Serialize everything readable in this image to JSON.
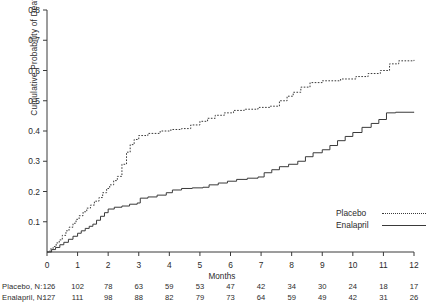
{
  "chart_data": {
    "type": "line",
    "title": "",
    "xlabel": "Months",
    "ylabel": "Cumulative Probability of Death",
    "xlim": [
      0,
      12
    ],
    "ylim": [
      0,
      0.8
    ],
    "xticks": [
      "0",
      "1",
      "2",
      "3",
      "4",
      "5",
      "6",
      "7",
      "8",
      "9",
      "10",
      "11",
      "12"
    ],
    "yticks": [
      "0.8",
      "0.7",
      "0.6",
      "0.5",
      "0.4",
      "0.3",
      "0.2",
      "0.1"
    ],
    "ytick_values": [
      0.8,
      0.7,
      0.6,
      0.5,
      0.4,
      0.3,
      0.2,
      0.1
    ],
    "grid": false,
    "legend_position": "lower right",
    "series": [
      {
        "name": "Placebo",
        "style": "dotted",
        "color": "#3a3a3a",
        "points": [
          [
            0.0,
            0.0
          ],
          [
            0.1,
            0.01
          ],
          [
            0.2,
            0.018
          ],
          [
            0.3,
            0.03
          ],
          [
            0.4,
            0.04
          ],
          [
            0.5,
            0.055
          ],
          [
            0.62,
            0.07
          ],
          [
            0.72,
            0.082
          ],
          [
            0.85,
            0.095
          ],
          [
            0.95,
            0.108
          ],
          [
            1.05,
            0.12
          ],
          [
            1.18,
            0.133
          ],
          [
            1.3,
            0.145
          ],
          [
            1.42,
            0.155
          ],
          [
            1.55,
            0.168
          ],
          [
            1.7,
            0.18
          ],
          [
            1.82,
            0.196
          ],
          [
            1.95,
            0.21
          ],
          [
            2.05,
            0.222
          ],
          [
            2.18,
            0.236
          ],
          [
            2.3,
            0.25
          ],
          [
            2.45,
            0.29
          ],
          [
            2.6,
            0.33
          ],
          [
            2.72,
            0.355
          ],
          [
            2.85,
            0.372
          ],
          [
            3.0,
            0.385
          ],
          [
            3.3,
            0.392
          ],
          [
            3.7,
            0.4
          ],
          [
            4.05,
            0.405
          ],
          [
            4.4,
            0.408
          ],
          [
            4.7,
            0.42
          ],
          [
            5.0,
            0.432
          ],
          [
            5.25,
            0.442
          ],
          [
            5.5,
            0.452
          ],
          [
            5.8,
            0.46
          ],
          [
            6.1,
            0.468
          ],
          [
            6.45,
            0.472
          ],
          [
            6.9,
            0.478
          ],
          [
            7.3,
            0.482
          ],
          [
            7.6,
            0.5
          ],
          [
            7.85,
            0.515
          ],
          [
            8.05,
            0.528
          ],
          [
            8.3,
            0.545
          ],
          [
            8.6,
            0.56
          ],
          [
            9.0,
            0.566
          ],
          [
            9.6,
            0.572
          ],
          [
            10.1,
            0.58
          ],
          [
            10.5,
            0.59
          ],
          [
            10.9,
            0.6
          ],
          [
            11.2,
            0.622
          ],
          [
            11.5,
            0.632
          ],
          [
            12.0,
            0.635
          ]
        ]
      },
      {
        "name": "Enalapril",
        "style": "solid",
        "color": "#3a3a3a",
        "points": [
          [
            0.0,
            0.0
          ],
          [
            0.15,
            0.008
          ],
          [
            0.28,
            0.015
          ],
          [
            0.42,
            0.024
          ],
          [
            0.55,
            0.032
          ],
          [
            0.7,
            0.042
          ],
          [
            0.85,
            0.052
          ],
          [
            1.0,
            0.062
          ],
          [
            1.12,
            0.07
          ],
          [
            1.25,
            0.078
          ],
          [
            1.38,
            0.085
          ],
          [
            1.5,
            0.092
          ],
          [
            1.62,
            0.105
          ],
          [
            1.75,
            0.118
          ],
          [
            1.88,
            0.13
          ],
          [
            2.0,
            0.142
          ],
          [
            2.2,
            0.148
          ],
          [
            2.45,
            0.152
          ],
          [
            2.7,
            0.158
          ],
          [
            2.95,
            0.162
          ],
          [
            3.05,
            0.178
          ],
          [
            3.3,
            0.182
          ],
          [
            3.6,
            0.188
          ],
          [
            3.9,
            0.196
          ],
          [
            4.1,
            0.205
          ],
          [
            4.4,
            0.21
          ],
          [
            4.75,
            0.212
          ],
          [
            5.1,
            0.214
          ],
          [
            5.3,
            0.222
          ],
          [
            5.6,
            0.228
          ],
          [
            5.9,
            0.234
          ],
          [
            6.2,
            0.24
          ],
          [
            6.55,
            0.244
          ],
          [
            6.9,
            0.248
          ],
          [
            7.1,
            0.262
          ],
          [
            7.35,
            0.272
          ],
          [
            7.6,
            0.282
          ],
          [
            7.9,
            0.29
          ],
          [
            8.2,
            0.3
          ],
          [
            8.45,
            0.315
          ],
          [
            8.7,
            0.328
          ],
          [
            9.0,
            0.338
          ],
          [
            9.25,
            0.352
          ],
          [
            9.5,
            0.368
          ],
          [
            9.75,
            0.382
          ],
          [
            10.0,
            0.395
          ],
          [
            10.3,
            0.412
          ],
          [
            10.6,
            0.425
          ],
          [
            10.85,
            0.438
          ],
          [
            11.1,
            0.46
          ],
          [
            11.4,
            0.462
          ],
          [
            12.0,
            0.463
          ]
        ]
      }
    ],
    "risk_table": {
      "row_labels": [
        "Placebo,  N:",
        "Enalapril, N:"
      ],
      "times": [
        "0",
        "1",
        "2",
        "3",
        "4",
        "5",
        "6",
        "7",
        "8",
        "9",
        "10",
        "11",
        "12"
      ],
      "rows": [
        {
          "name": "Placebo",
          "counts": [
            "126",
            "102",
            "78",
            "63",
            "59",
            "53",
            "47",
            "42",
            "34",
            "30",
            "24",
            "18",
            "17"
          ]
        },
        {
          "name": "Enalapril",
          "counts": [
            "127",
            "111",
            "98",
            "88",
            "82",
            "79",
            "73",
            "64",
            "59",
            "49",
            "42",
            "31",
            "26"
          ]
        }
      ]
    }
  },
  "legend": {
    "items": [
      {
        "label": "Placebo",
        "style": "dotted"
      },
      {
        "label": "Enalapril",
        "style": "solid"
      }
    ]
  }
}
